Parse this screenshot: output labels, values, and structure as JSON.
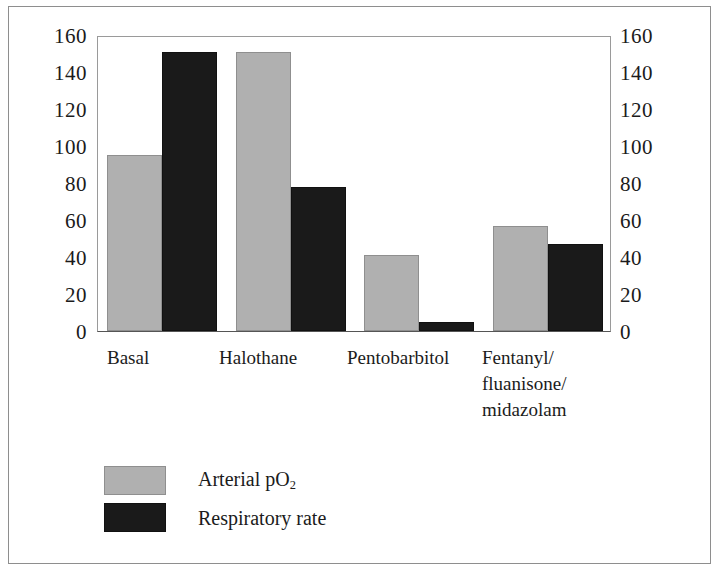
{
  "chart_data": {
    "type": "bar",
    "title": "",
    "xlabel": "",
    "ylabel": "",
    "ylim": [
      0,
      160
    ],
    "yticks": [
      0,
      20,
      40,
      60,
      80,
      100,
      120,
      140,
      160
    ],
    "ytick_labels": [
      "0",
      "20",
      "40",
      "60",
      "80",
      "100",
      "120",
      "140",
      "160"
    ],
    "grid": false,
    "dual_axis": true,
    "left_axis_labels": [
      "160",
      "140",
      "120",
      "100",
      "80",
      "60",
      "40",
      "20",
      "0"
    ],
    "right_axis_labels": [
      "160",
      "140",
      "120",
      "100",
      "80",
      "60",
      "40",
      "20",
      "0"
    ],
    "legend_position": "below-left",
    "categories": [
      "Basal",
      "Halothane",
      "Pentobarbitol",
      "Fentanyl/\nfluanisone/\nmidazolam"
    ],
    "series": [
      {
        "name": "Arterial pO2",
        "label_html": "Arterial pO<sub>2</sub>",
        "color": "#b0b0b0",
        "values": [
          95,
          151,
          41,
          57
        ]
      },
      {
        "name": "Respiratory rate",
        "label_html": "Respiratory rate",
        "color": "#1a1a1a",
        "values": [
          151,
          78,
          5,
          47
        ]
      }
    ]
  },
  "legend": {
    "items": [
      {
        "label": "Arterial pO2",
        "color": "#b0b0b0"
      },
      {
        "label": "Respiratory rate",
        "color": "#1a1a1a"
      }
    ]
  },
  "colors": {
    "series_gray": "#b0b0b0",
    "series_dark": "#1a1a1a",
    "frame": "#8e8e8e",
    "axis": "#555555",
    "text": "#1b1b1b",
    "background": "#ffffff"
  }
}
